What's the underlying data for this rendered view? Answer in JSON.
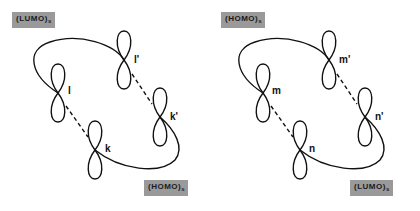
{
  "panels": [
    {
      "id": "left",
      "top_label": {
        "text": "(LUMO)",
        "sub": "s"
      },
      "bottom_label": {
        "text": "(HOMO)",
        "sub": "s"
      },
      "orbitals": {
        "upper_left": "l",
        "upper_right": "l'",
        "lower_left": "k",
        "lower_right": "k'"
      }
    },
    {
      "id": "right",
      "top_label": {
        "text": "(HOMO)",
        "sub": "s"
      },
      "bottom_label": {
        "text": "(LUMO)",
        "sub": "s"
      },
      "orbitals": {
        "upper_left": "m",
        "upper_right": "m'",
        "lower_left": "n",
        "lower_right": "n'"
      }
    }
  ],
  "colors": {
    "stroke": "#111111",
    "tag_bg": "#9a9a9a",
    "background": "#ffffff"
  }
}
